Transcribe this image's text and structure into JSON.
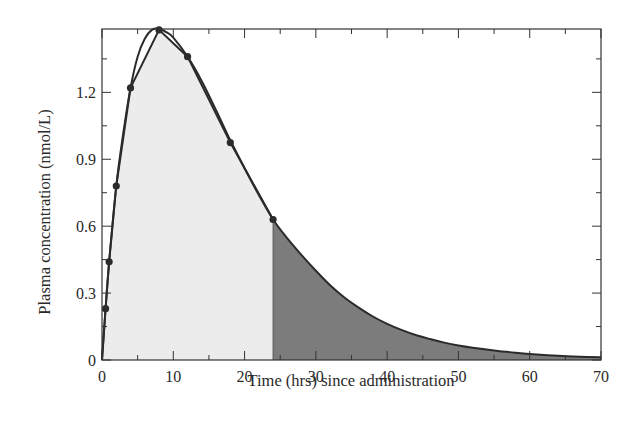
{
  "chart_data": {
    "type": "area",
    "title": "",
    "xlabel": "Time (hrs) since administration",
    "ylabel": "Plasma concentration (nmol/L)",
    "xlim": [
      0,
      70
    ],
    "ylim": [
      0,
      1.484
    ],
    "x_ticks": [
      0,
      10,
      20,
      30,
      40,
      50,
      60,
      70
    ],
    "x_tick_labels": [
      "0",
      "10",
      "20",
      "30",
      "40",
      "50",
      "60",
      "70"
    ],
    "x_minor_step": 5,
    "y_ticks": [
      0,
      0.3,
      0.6,
      0.9,
      1.2
    ],
    "y_tick_labels": [
      "0",
      "0.3",
      "0.6",
      "0.9",
      "1.2"
    ],
    "y_minor_step": 0.15,
    "grid": false,
    "legend": null,
    "series": [
      {
        "name": "Measured concentrations",
        "style": "line-with-markers",
        "x": [
          0,
          0.5,
          1,
          2,
          4,
          8,
          12,
          18,
          24
        ],
        "values": [
          0,
          0.23,
          0.44,
          0.78,
          1.22,
          1.48,
          1.36,
          0.975,
          0.63
        ]
      },
      {
        "name": "Fitted curve",
        "style": "smooth-line",
        "x": [
          0,
          0.5,
          1,
          2,
          3,
          4,
          5,
          6,
          7,
          8,
          9,
          10,
          12,
          14,
          16,
          18,
          20,
          22,
          24,
          26,
          28,
          30,
          32,
          34,
          36,
          38,
          40,
          42,
          44,
          46,
          48,
          50,
          52,
          55,
          58,
          61,
          64,
          67,
          70
        ],
        "values": [
          0,
          0.23,
          0.44,
          0.78,
          1.02,
          1.22,
          1.36,
          1.44,
          1.48,
          1.485,
          1.47,
          1.445,
          1.36,
          1.25,
          1.12,
          0.985,
          0.86,
          0.74,
          0.63,
          0.545,
          0.47,
          0.4,
          0.335,
          0.28,
          0.235,
          0.195,
          0.162,
          0.135,
          0.112,
          0.094,
          0.078,
          0.065,
          0.055,
          0.043,
          0.033,
          0.025,
          0.019,
          0.015,
          0.012
        ]
      }
    ],
    "shaded_regions": [
      {
        "name": "AUC 0-24 h",
        "from": 0,
        "to": 24,
        "follows": "Measured concentrations",
        "color": "#ececec"
      },
      {
        "name": "AUC 24 h to infinity (extrapolated)",
        "from": 24,
        "to": 70,
        "follows": "Fitted curve",
        "color": "#7c7c7c"
      }
    ],
    "colors": {
      "line": "#2b2b2b",
      "axis": "#333333",
      "light_fill": "#ececec",
      "dark_fill": "#7c7c7c"
    }
  }
}
